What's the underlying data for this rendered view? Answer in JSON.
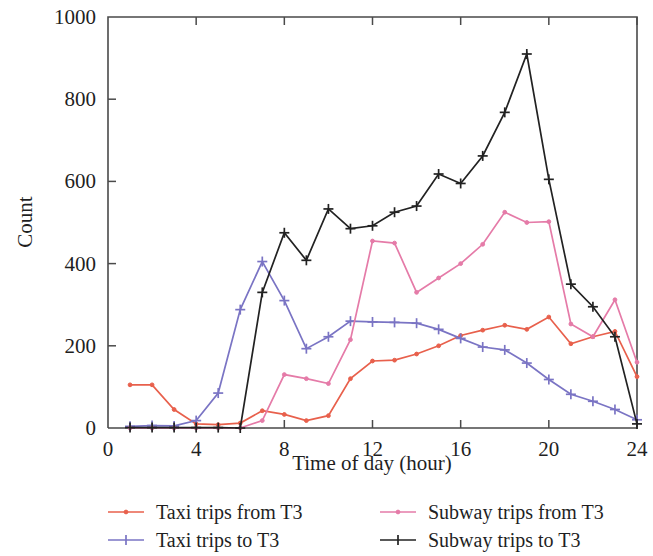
{
  "chart_data": {
    "type": "line",
    "title": "",
    "xlabel": "Time of day (hour)",
    "ylabel": "Count",
    "xlim": [
      0,
      24
    ],
    "ylim": [
      0,
      1000
    ],
    "xticks": [
      0,
      4,
      8,
      12,
      16,
      20,
      24
    ],
    "yticks": [
      0,
      200,
      400,
      600,
      800,
      1000
    ],
    "xtick_labels": [
      "0",
      "4",
      "8",
      "12",
      "16",
      "20",
      "24"
    ],
    "ytick_labels": [
      "0",
      "200",
      "400",
      "600",
      "800",
      "1000"
    ],
    "grid": false,
    "legend_position": "below",
    "x": [
      1,
      2,
      3,
      4,
      5,
      6,
      7,
      8,
      9,
      10,
      11,
      12,
      13,
      14,
      15,
      16,
      17,
      18,
      19,
      20,
      21,
      22,
      23,
      24
    ],
    "series": [
      {
        "name": "Taxi trips from T3",
        "color": "#e8604c",
        "marker": "dot",
        "values": [
          105,
          105,
          45,
          10,
          8,
          12,
          42,
          33,
          18,
          30,
          120,
          163,
          165,
          180,
          200,
          225,
          238,
          250,
          240,
          270,
          205,
          222,
          235,
          125
        ]
      },
      {
        "name": "Taxi trips to T3",
        "color": "#7a74c4",
        "marker": "plus",
        "values": [
          4,
          6,
          5,
          18,
          85,
          288,
          405,
          310,
          193,
          222,
          260,
          258,
          257,
          255,
          240,
          218,
          197,
          190,
          158,
          118,
          82,
          65,
          45,
          20
        ]
      },
      {
        "name": "Subway trips from T3",
        "color": "#e57ba8",
        "marker": "dot",
        "values": [
          0,
          0,
          0,
          0,
          0,
          0,
          18,
          130,
          120,
          108,
          215,
          455,
          450,
          330,
          365,
          400,
          447,
          525,
          500,
          502,
          253,
          222,
          312,
          160
        ]
      },
      {
        "name": "Subway trips to T3",
        "color": "#222222",
        "marker": "plus",
        "values": [
          1,
          1,
          1,
          1,
          1,
          0,
          330,
          475,
          408,
          533,
          485,
          492,
          525,
          540,
          618,
          595,
          662,
          768,
          910,
          605,
          350,
          295,
          222,
          10
        ]
      }
    ]
  },
  "legend": {
    "entries": [
      {
        "label": "Taxi trips from T3",
        "color": "#e8604c",
        "marker": "dot"
      },
      {
        "label": "Subway trips from T3",
        "color": "#e57ba8",
        "marker": "dot"
      },
      {
        "label": "Taxi trips to T3",
        "color": "#7a74c4",
        "marker": "plus"
      },
      {
        "label": "Subway trips to T3",
        "color": "#222222",
        "marker": "plus"
      }
    ]
  }
}
